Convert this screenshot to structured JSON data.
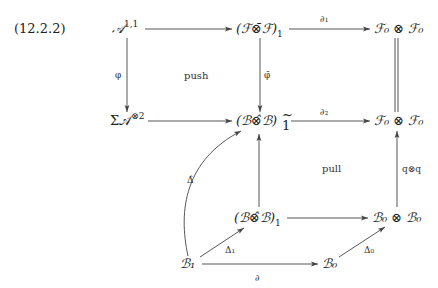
{
  "equation_number": "(12.2.2)",
  "nodes": {
    "A11": "𝒜",
    "A11_sup": "1,1",
    "FF1": "(ℱ⊗̄ℱ)",
    "FF1_sub": "1",
    "F0F0_top": "ℱ₀ ⊗ ℱ₀",
    "SigmaA": "Σ𝒜",
    "SigmaA_sup": "⊗2",
    "BB1tilde": "(ℬ⊗̂ℬ)",
    "BB1tilde_sup": "~",
    "BB1tilde_sub": "1",
    "F0F0_mid": "ℱ₀ ⊗ ℱ₀",
    "BB1": "(ℬ⊗̂ℬ)",
    "BB1_sub": "1",
    "B0B0": "ℬ₀ ⊗ ℬ₀",
    "B1": "ℬ₁",
    "B0": "ℬ₀"
  },
  "edge_labels": {
    "partial1": "∂₁",
    "phi": "φ",
    "phibar": "φ̄",
    "partial2": "∂₂",
    "qq": "q⊗q",
    "Deltahat": "Δ̂",
    "Delta1": "Δ₁",
    "Delta0": "Δ₀",
    "partial": "∂"
  },
  "region_labels": {
    "push": "push",
    "pull": "pull"
  },
  "edges": [
    {
      "from": "A11",
      "to": "FF1",
      "label": ""
    },
    {
      "from": "FF1",
      "to": "F0F0_top",
      "label": "∂₁"
    },
    {
      "from": "A11",
      "to": "SigmaA",
      "label": "φ"
    },
    {
      "from": "FF1",
      "to": "BB1tilde",
      "label": "φ̄"
    },
    {
      "from": "F0F0_top",
      "to": "F0F0_mid",
      "label": "",
      "style": "double"
    },
    {
      "from": "SigmaA",
      "to": "BB1tilde",
      "label": ""
    },
    {
      "from": "BB1tilde",
      "to": "F0F0_mid",
      "label": "∂₂"
    },
    {
      "from": "BB1",
      "to": "BB1tilde",
      "label": ""
    },
    {
      "from": "B0B0",
      "to": "F0F0_mid",
      "label": "q⊗q"
    },
    {
      "from": "BB1",
      "to": "B0B0",
      "label": ""
    },
    {
      "from": "B1",
      "to": "BB1tilde",
      "label": "Δ̂",
      "style": "curved"
    },
    {
      "from": "B1",
      "to": "BB1",
      "label": "Δ₁"
    },
    {
      "from": "B0",
      "to": "B0B0",
      "label": "Δ₀"
    },
    {
      "from": "B1",
      "to": "B0",
      "label": "∂"
    }
  ]
}
